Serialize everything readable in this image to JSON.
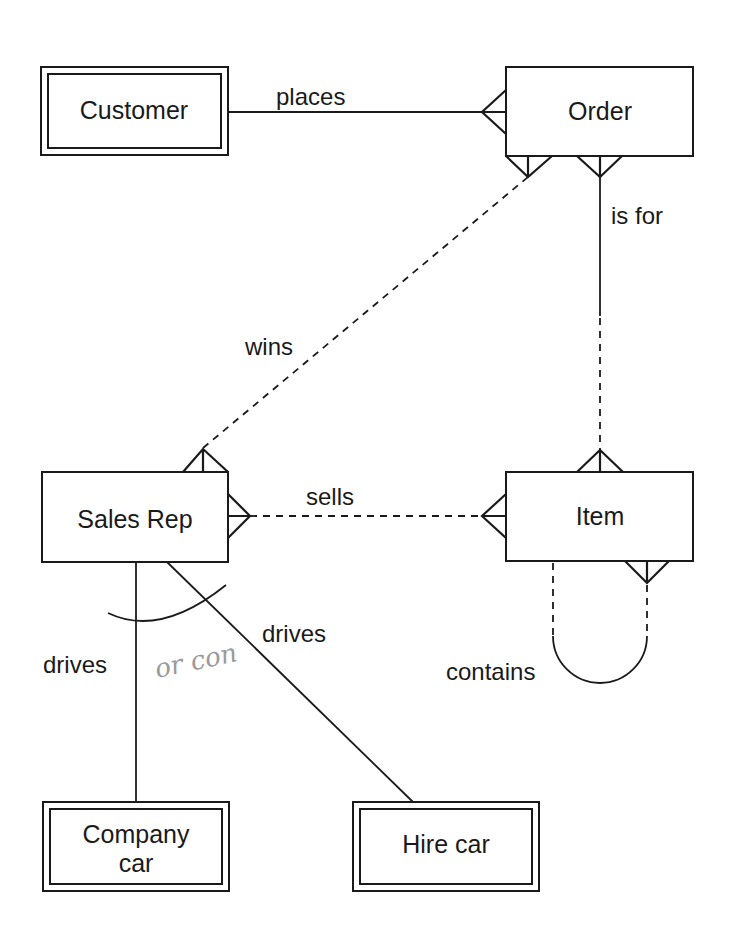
{
  "diagram": {
    "type": "entity-relationship",
    "colors": {
      "ink": "#1a1a1a",
      "background": "#ffffff",
      "handwriting": "#9a9a9a"
    },
    "entities": {
      "customer": {
        "label": "Customer",
        "style": "double-border"
      },
      "order": {
        "label": "Order",
        "style": "single-border"
      },
      "sales_rep": {
        "label": "Sales Rep",
        "style": "single-border"
      },
      "item": {
        "label": "Item",
        "style": "single-border"
      },
      "company_car": {
        "label_line1": "Company",
        "label_line2": "car",
        "style": "double-border"
      },
      "hire_car": {
        "label": "Hire car",
        "style": "double-border"
      }
    },
    "relationships": {
      "places": {
        "label": "places",
        "from": "Customer",
        "to": "Order",
        "line": "solid",
        "crows_foot_at": "Order"
      },
      "is_for": {
        "label": "is for",
        "from": "Order",
        "to": "Item",
        "line": "solid-then-dashed",
        "crows_foot_at": [
          "Order",
          "Item"
        ]
      },
      "wins": {
        "label": "wins",
        "from": "Sales Rep",
        "to": "Order",
        "line": "dashed",
        "crows_foot_at": [
          "Order",
          "Sales Rep"
        ]
      },
      "sells": {
        "label": "sells",
        "from": "Sales Rep",
        "to": "Item",
        "line": "dashed",
        "crows_foot_at": [
          "Sales Rep",
          "Item"
        ]
      },
      "contains": {
        "label": "contains",
        "from": "Item",
        "to": "Item",
        "line": "dashed-loop",
        "crows_foot_at": "Item"
      },
      "drives_company": {
        "label": "drives",
        "from": "Sales Rep",
        "to": "Company car",
        "line": "solid"
      },
      "drives_hire": {
        "label": "drives",
        "from": "Sales Rep",
        "to": "Hire car",
        "line": "solid"
      }
    },
    "exclusive_arc": {
      "spans": [
        "drives_company",
        "drives_hire"
      ]
    },
    "annotation": {
      "text": "or con",
      "style": "handwritten"
    }
  }
}
